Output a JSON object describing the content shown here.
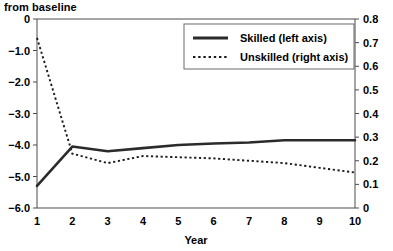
{
  "chart_data": {
    "type": "line",
    "title": "from baseline",
    "xlabel": "Year",
    "ylabel": "",
    "x": [
      1,
      2,
      3,
      4,
      5,
      6,
      7,
      8,
      9,
      10
    ],
    "xticklabels": [
      "1",
      "2",
      "3",
      "4",
      "5",
      "6",
      "7",
      "8",
      "9",
      "10"
    ],
    "xlim": [
      1,
      10
    ],
    "ylim": [
      -6.0,
      0.0
    ],
    "yticklabels": [
      "0",
      "-1.0",
      "-2.0",
      "-3.0",
      "-4.0",
      "-5.0",
      "-6.0"
    ],
    "ytickvalues": [
      0,
      -1.0,
      -2.0,
      -3.0,
      -4.0,
      -5.0,
      -6.0
    ],
    "y2lim": [
      0.0,
      0.8
    ],
    "y2ticklabels": [
      "0.8",
      "0.7",
      "0.6",
      "0.5",
      "0.4",
      "0.3",
      "0.2",
      "0.1",
      "0"
    ],
    "y2tickvalues": [
      0.8,
      0.7,
      0.6,
      0.5,
      0.4,
      0.3,
      0.2,
      0.1,
      0
    ],
    "grid": false,
    "legend_position": "top-right",
    "series": [
      {
        "name": "Skilled (left axis)",
        "axis": "left",
        "style": "solid",
        "color": "#2b2b2b",
        "values": [
          -5.3,
          -4.05,
          -4.2,
          -4.1,
          -4.0,
          -3.95,
          -3.92,
          -3.85,
          -3.85,
          -3.85
        ]
      },
      {
        "name": "Unskilled (right axis)",
        "axis": "right",
        "style": "dotted",
        "color": "#1a1a1a",
        "values": [
          0.72,
          0.23,
          0.19,
          0.22,
          0.215,
          0.21,
          0.2,
          0.19,
          0.17,
          0.15
        ]
      }
    ]
  },
  "legend": {
    "entries": [
      {
        "label": "Skilled (left axis)"
      },
      {
        "label": "Unskilled (right axis)"
      }
    ]
  }
}
